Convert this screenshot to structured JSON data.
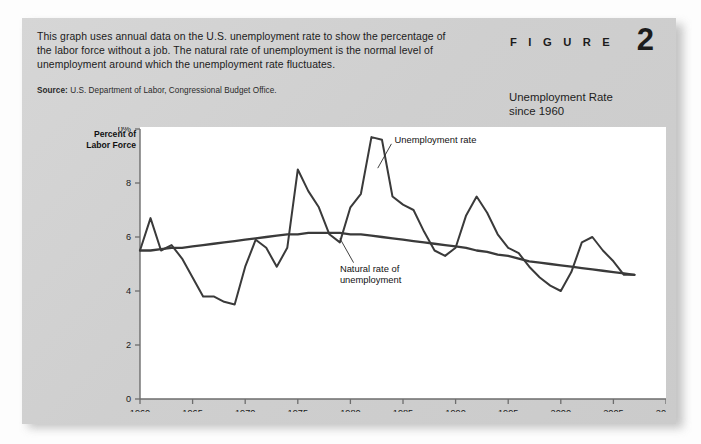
{
  "figure": {
    "label": "F I G U R E",
    "number": "2",
    "title_line1": "Unemployment Rate",
    "title_line2": "since 1960"
  },
  "caption": "This graph uses annual data on the U.S. unemployment rate to show the percentage of the labor force without a job. The natural rate of unemployment is the normal level of unemployment around which the unemployment rate fluctuates.",
  "source": {
    "label": "Source:",
    "text": "U.S. Department of Labor, Congressional Budget Office."
  },
  "chart_data": {
    "type": "line",
    "title": "Unemployment Rate since 1960",
    "xlabel": "",
    "ylabel": "Percent of Labor Force",
    "ylabel_line1": "Percent of",
    "ylabel_line2": "Labor Force",
    "xlim": [
      1960,
      2010
    ],
    "ylim": [
      0,
      10
    ],
    "yticks": [
      0,
      2,
      4,
      6,
      8,
      10
    ],
    "ytick_labels": [
      "0",
      "2",
      "4",
      "6",
      "8",
      "10%"
    ],
    "xticks": [
      1960,
      1965,
      1970,
      1975,
      1980,
      1985,
      1990,
      1995,
      2000,
      2005,
      2010
    ],
    "xtick_labels": [
      "1960",
      "1965",
      "1970",
      "1975",
      "1980",
      "1985",
      "1990",
      "1995",
      "2000",
      "2005",
      "2010"
    ],
    "grid": false,
    "legend": "annotations",
    "annotations": [
      {
        "name": "unemployment-rate-label",
        "text": "Unemployment rate",
        "x": 1984.2,
        "y": 9.6
      },
      {
        "name": "natural-rate-label",
        "text_line1": "Natural rate of",
        "text_line2": "unemployment",
        "x": 1979.0,
        "y": 4.8
      }
    ],
    "x": [
      1960,
      1961,
      1962,
      1963,
      1964,
      1965,
      1966,
      1967,
      1968,
      1969,
      1970,
      1971,
      1972,
      1973,
      1974,
      1975,
      1976,
      1977,
      1978,
      1979,
      1980,
      1981,
      1982,
      1983,
      1984,
      1985,
      1986,
      1987,
      1988,
      1989,
      1990,
      1991,
      1992,
      1993,
      1994,
      1995,
      1996,
      1997,
      1998,
      1999,
      2000,
      2001,
      2002,
      2003,
      2004,
      2005,
      2006,
      2007
    ],
    "series": [
      {
        "name": "Unemployment rate",
        "color": "#3a3a3a",
        "values": [
          5.5,
          6.7,
          5.5,
          5.7,
          5.2,
          4.5,
          3.8,
          3.8,
          3.6,
          3.5,
          4.9,
          5.9,
          5.6,
          4.9,
          5.6,
          8.5,
          7.7,
          7.1,
          6.1,
          5.8,
          7.1,
          7.6,
          9.7,
          9.6,
          7.5,
          7.2,
          7.0,
          6.2,
          5.5,
          5.3,
          5.6,
          6.8,
          7.5,
          6.9,
          6.1,
          5.6,
          5.4,
          4.9,
          4.5,
          4.2,
          4.0,
          4.7,
          5.8,
          6.0,
          5.5,
          5.1,
          4.6,
          4.6
        ]
      },
      {
        "name": "Natural rate of unemployment",
        "color": "#3a3a3a",
        "values": [
          5.5,
          5.5,
          5.55,
          5.6,
          5.6,
          5.65,
          5.7,
          5.75,
          5.8,
          5.85,
          5.9,
          5.95,
          6.0,
          6.05,
          6.1,
          6.1,
          6.15,
          6.15,
          6.15,
          6.15,
          6.1,
          6.1,
          6.05,
          6.0,
          5.95,
          5.9,
          5.85,
          5.8,
          5.75,
          5.7,
          5.65,
          5.6,
          5.5,
          5.45,
          5.35,
          5.3,
          5.2,
          5.1,
          5.05,
          5.0,
          4.95,
          4.9,
          4.85,
          4.8,
          4.75,
          4.7,
          4.65,
          4.6
        ]
      }
    ]
  }
}
